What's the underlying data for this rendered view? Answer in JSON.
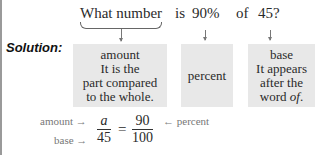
{
  "question": {
    "phrase": "What number",
    "is": "is",
    "percent": "90%",
    "of": "of",
    "base": "45?"
  },
  "solution_label": "Solution:",
  "boxes": {
    "amount": {
      "lines": [
        "amount",
        "It is the",
        "part compared",
        "to the whole."
      ]
    },
    "percent": {
      "lines": [
        "percent"
      ]
    },
    "base": {
      "lines": [
        "base",
        "It appears",
        "after the",
        "word "
      ],
      "italic_word": "of",
      "trail": "."
    }
  },
  "proportion": {
    "amount_label": "amount →",
    "base_label": "base →",
    "percent_label": "← percent",
    "left_numerator": "a",
    "left_denominator": "45",
    "equals": "=",
    "right_numerator": "90",
    "right_denominator": "100"
  }
}
